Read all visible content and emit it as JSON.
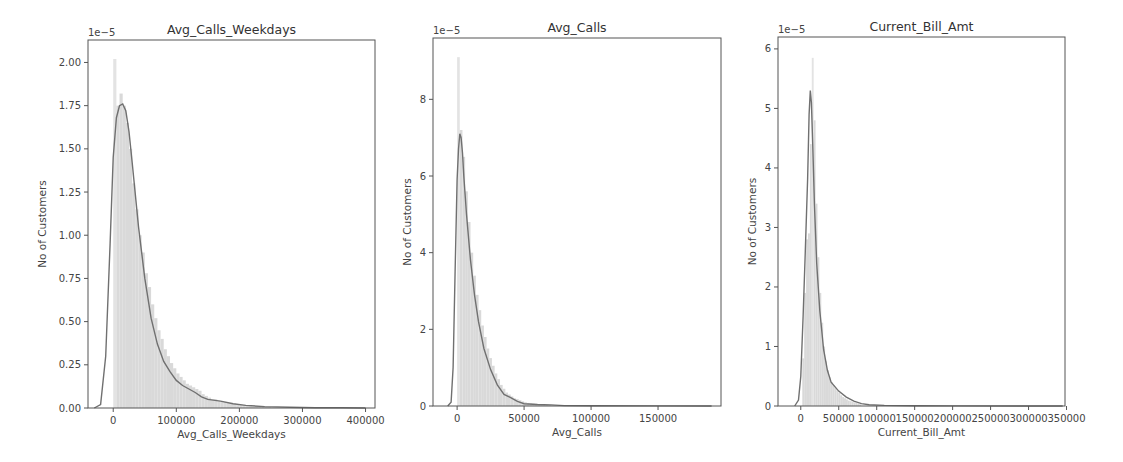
{
  "chart_data": [
    {
      "type": "histogram+kde",
      "title": "Avg_Calls_Weekdays",
      "xlabel": "Avg_Calls_Weekdays",
      "ylabel": "No of Customers",
      "y_offset_label": "1e−5",
      "x_ticks": [
        0,
        100000,
        200000,
        300000,
        400000
      ],
      "x_tick_labels": [
        "0",
        "100000",
        "200000",
        "300000",
        "400000"
      ],
      "y_ticks": [
        0.0,
        0.25,
        0.5,
        0.75,
        1.0,
        1.25,
        1.5,
        1.75,
        2.0
      ],
      "y_tick_labels": [
        "0.00",
        "0.25",
        "0.50",
        "0.75",
        "1.00",
        "1.25",
        "1.50",
        "1.75",
        "2.00"
      ],
      "xlim": [
        -40000,
        415000
      ],
      "ylim": [
        0,
        2.13
      ],
      "grid": false,
      "kde": {
        "x": [
          -30000,
          -20000,
          -12000,
          -5000,
          0,
          5000,
          10000,
          15000,
          20000,
          25000,
          30000,
          40000,
          50000,
          60000,
          70000,
          80000,
          90000,
          100000,
          110000,
          120000,
          130000,
          140000,
          150000,
          170000,
          190000,
          210000,
          240000,
          280000,
          320000,
          360000,
          400000
        ],
        "y": [
          0.0,
          0.02,
          0.3,
          0.95,
          1.45,
          1.68,
          1.75,
          1.76,
          1.72,
          1.6,
          1.42,
          1.05,
          0.75,
          0.52,
          0.37,
          0.27,
          0.21,
          0.16,
          0.13,
          0.11,
          0.09,
          0.065,
          0.05,
          0.04,
          0.025,
          0.015,
          0.008,
          0.004,
          0.002,
          0.001,
          0.0
        ]
      },
      "histogram": {
        "bin_edges_start": 0,
        "bin_width": 5000,
        "heights": [
          2.02,
          1.75,
          1.82,
          1.75,
          1.65,
          1.5,
          1.3,
          1.15,
          1.0,
          0.9,
          0.78,
          0.7,
          0.6,
          0.52,
          0.45,
          0.4,
          0.34,
          0.3,
          0.26,
          0.23,
          0.2,
          0.18,
          0.16,
          0.14,
          0.13,
          0.12,
          0.11,
          0.1,
          0.08,
          0.07,
          0.06,
          0.05,
          0.05,
          0.04,
          0.04,
          0.035,
          0.03,
          0.03,
          0.025,
          0.02,
          0.02,
          0.018,
          0.015,
          0.012,
          0.01,
          0.01,
          0.008,
          0.006,
          0.005,
          0.004
        ]
      }
    },
    {
      "type": "histogram+kde",
      "title": "Avg_Calls",
      "xlabel": "Avg_Calls",
      "ylabel": "No of Customers",
      "y_offset_label": "1e−5",
      "x_ticks": [
        0,
        50000,
        100000,
        150000
      ],
      "x_tick_labels": [
        "0",
        "50000",
        "100000",
        "150000"
      ],
      "y_ticks": [
        0,
        2,
        4,
        6,
        8
      ],
      "y_tick_labels": [
        "0",
        "2",
        "4",
        "6",
        "8"
      ],
      "xlim": [
        -18000,
        197000
      ],
      "ylim": [
        0,
        9.6
      ],
      "grid": false,
      "kde": {
        "x": [
          -7000,
          -4500,
          -3000,
          -1500,
          0,
          1000,
          2000,
          3000,
          4000,
          5000,
          7000,
          10000,
          13000,
          16000,
          20000,
          25000,
          30000,
          35000,
          40000,
          45000,
          50000,
          60000,
          70000,
          80000,
          100000,
          150000,
          190000
        ],
        "y": [
          0.0,
          0.1,
          1.0,
          3.5,
          5.9,
          6.7,
          7.1,
          7.0,
          6.6,
          6.0,
          5.0,
          3.8,
          2.9,
          2.2,
          1.5,
          0.95,
          0.55,
          0.3,
          0.22,
          0.12,
          0.06,
          0.04,
          0.03,
          0.01,
          0.005,
          0.002,
          0.0
        ]
      },
      "histogram": {
        "bin_edges_start": 0,
        "bin_width": 2000,
        "heights": [
          9.1,
          7.2,
          6.5,
          5.6,
          4.8,
          4.0,
          3.4,
          2.9,
          2.5,
          2.1,
          1.8,
          1.5,
          1.25,
          1.05,
          0.85,
          0.7,
          0.55,
          0.45,
          0.35,
          0.3,
          0.25,
          0.2,
          0.18,
          0.15,
          0.12,
          0.1,
          0.08,
          0.07,
          0.06,
          0.05,
          0.04,
          0.04,
          0.03,
          0.03,
          0.02
        ]
      }
    },
    {
      "type": "histogram+kde",
      "title": "Current_Bill_Amt",
      "xlabel": "Current_Bill_Amt",
      "ylabel": "No of Customers",
      "y_offset_label": "1e−5",
      "x_ticks": [
        0,
        50000,
        100000,
        150000,
        200000,
        250000,
        300000,
        350000
      ],
      "x_tick_labels": [
        "0",
        "50000",
        "100000",
        "150000",
        "200000",
        "250000",
        "300000",
        "350000"
      ],
      "y_ticks": [
        0,
        1,
        2,
        3,
        4,
        5,
        6
      ],
      "y_tick_labels": [
        "0",
        "1",
        "2",
        "3",
        "4",
        "5",
        "6"
      ],
      "xlim": [
        -30000,
        348000
      ],
      "ylim": [
        0,
        6.2
      ],
      "grid": false,
      "kde": {
        "x": [
          -8000,
          -3000,
          0,
          3000,
          6000,
          9000,
          11000,
          12500,
          14000,
          16000,
          18000,
          21000,
          25000,
          30000,
          35000,
          40000,
          50000,
          60000,
          70000,
          80000,
          90000,
          110000,
          150000,
          200000,
          345000
        ],
        "y": [
          0.0,
          0.1,
          0.5,
          1.5,
          2.6,
          3.8,
          4.9,
          5.3,
          5.1,
          4.3,
          3.4,
          2.4,
          1.6,
          0.95,
          0.6,
          0.4,
          0.25,
          0.15,
          0.08,
          0.04,
          0.02,
          0.01,
          0.005,
          0.002,
          0.0
        ]
      },
      "histogram": {
        "bin_edges_start": 2000,
        "bin_width": 2500,
        "heights": [
          0.8,
          1.9,
          2.8,
          2.9,
          4.4,
          5.85,
          4.8,
          3.4,
          2.5,
          1.9,
          1.4,
          1.0,
          0.75,
          0.6,
          0.48,
          0.4,
          0.35,
          0.3,
          0.26,
          0.22,
          0.18,
          0.15,
          0.13,
          0.11,
          0.09,
          0.08,
          0.07,
          0.06,
          0.05,
          0.04,
          0.03
        ]
      }
    }
  ],
  "colors": {
    "hist_fill": "#d9d9d9",
    "hist_peak": "#e3e3e3",
    "kde_line": "#707070",
    "axis": "#555555",
    "background": "#ffffff"
  },
  "layout": [
    {
      "left": 88,
      "right": 375,
      "top": 40,
      "bottom": 408
    },
    {
      "left": 433,
      "right": 721,
      "top": 38,
      "bottom": 406
    },
    {
      "left": 778,
      "right": 1065,
      "top": 37,
      "bottom": 406
    }
  ]
}
